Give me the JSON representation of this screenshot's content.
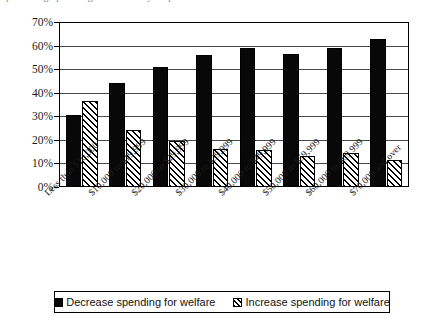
{
  "top_caption_fragment": "percentage pointing to the survey respondents",
  "chart_data": {
    "type": "bar",
    "title": "",
    "xlabel": "",
    "ylabel": "",
    "ylim": [
      0,
      70
    ],
    "ytick_labels": [
      "70%",
      "60%",
      "50%",
      "40%",
      "30%",
      "20%",
      "10%",
      "0%"
    ],
    "ytick_values": [
      70,
      60,
      50,
      40,
      30,
      20,
      10,
      0
    ],
    "ytick_suffix": "%",
    "grid": true,
    "legend_position": "bottom",
    "orientation": "vertical",
    "grouping": "grouped",
    "categories": [
      "Less than $10,000",
      "$10,000 to $19,999",
      "$20,000 to $29,999",
      "$30,000 to $39,999",
      "$40,000 to $49,999",
      "$50,000 to $59,999",
      "$60,000 to $69,999",
      "$70,000 and over"
    ],
    "series": [
      {
        "name": "Decrease spending for welfare",
        "pattern": "solid-black",
        "color": "#080808",
        "values": [
          30.5,
          44,
          51,
          56,
          59,
          56.5,
          59,
          63
        ]
      },
      {
        "name": "Increase spending for welfare",
        "pattern": "diagonal-hatch",
        "color": "#ffffff",
        "values": [
          36.5,
          24,
          19.5,
          16,
          15.5,
          13,
          14.5,
          11.5
        ]
      }
    ]
  },
  "legend": {
    "entries": [
      {
        "label": "Decrease spending for welfare",
        "swatch": "solid"
      },
      {
        "label": "Increase spending for welfare",
        "swatch": "hatch"
      }
    ]
  }
}
